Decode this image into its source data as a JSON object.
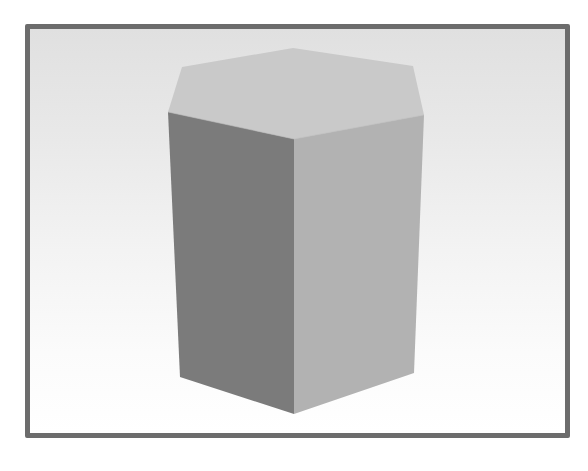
{
  "figure": {
    "colors": {
      "frame_border": "#6c6c6c",
      "background_top": "#e0e0e0",
      "background_bottom": "#ffffff",
      "top_face": "#c9c9c9",
      "left_face": "#7b7b7b",
      "right_face": "#b2b2b2"
    },
    "vertices": {
      "top": {
        "back": [
          293,
          48
        ],
        "back_left": [
          182,
          67
        ],
        "back_right": [
          413,
          66
        ],
        "left": [
          168,
          112
        ],
        "front": [
          294,
          139
        ],
        "right": [
          424,
          115
        ]
      },
      "bottom": {
        "left": [
          180,
          377
        ],
        "front": [
          294,
          414
        ],
        "right": [
          414,
          373
        ]
      }
    }
  }
}
